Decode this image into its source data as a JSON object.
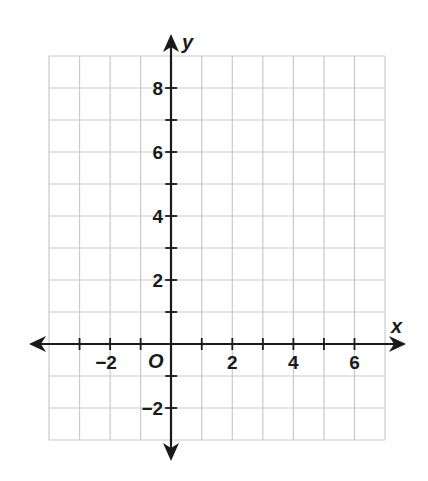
{
  "chart_data": {
    "type": "scatter",
    "title": "",
    "xlabel": "x",
    "ylabel": "y",
    "origin_label": "O",
    "xlim": [
      -4,
      7
    ],
    "ylim": [
      -3,
      9
    ],
    "grid": true,
    "x_tick_labels": [
      "−2",
      "2",
      "4",
      "6"
    ],
    "x_tick_label_values": [
      -2,
      2,
      4,
      6
    ],
    "y_tick_labels": [
      "8",
      "6",
      "4",
      "2",
      "−2"
    ],
    "y_tick_label_values": [
      8,
      6,
      4,
      2,
      -2
    ],
    "tick_step": 1,
    "series": [],
    "legend": null
  },
  "colors": {
    "grid": "#c9c9c9",
    "axis": "#1a1a1a",
    "background": "#ffffff"
  }
}
